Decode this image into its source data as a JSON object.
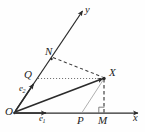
{
  "figure": {
    "background_color": "#fefefe",
    "stroke_color": "#2b2b2b",
    "light_stroke_color": "#9a9a9a",
    "width": 145,
    "height": 132
  },
  "axes": {
    "x_axis": {
      "label": "x",
      "origin": [
        14,
        113
      ],
      "tip": [
        140,
        113
      ],
      "arrow": true
    },
    "y_axis": {
      "label": "y",
      "origin": [
        14,
        113
      ],
      "tip": [
        84,
        8
      ],
      "arrow": true
    }
  },
  "basis_vectors": [
    {
      "name": "e1",
      "label": "e",
      "subscript": "1",
      "along": "x-axis",
      "tip": [
        44,
        113
      ]
    },
    {
      "name": "e2",
      "label": "e",
      "subscript": "2",
      "along": "y-axis",
      "tip": [
        33,
        85
      ]
    }
  ],
  "points": [
    {
      "name": "O",
      "label": "O",
      "x": 14,
      "y": 113
    },
    {
      "name": "N",
      "label": "N",
      "x": 50,
      "y": 58
    },
    {
      "name": "Q",
      "label": "Q",
      "x": 36,
      "y": 79
    },
    {
      "name": "X",
      "label": "X",
      "x": 104,
      "y": 78
    },
    {
      "name": "P",
      "label": "P",
      "x": 82,
      "y": 113
    },
    {
      "name": "M",
      "label": "M",
      "x": 104,
      "y": 113
    }
  ],
  "segments": [
    {
      "name": "vector-OX",
      "from": "O",
      "to": "X",
      "style": "solid-arrow",
      "weight": "bold"
    },
    {
      "name": "segment-N-X",
      "from": "N",
      "to": "X",
      "style": "dashed"
    },
    {
      "name": "segment-Q-X",
      "from": "Q",
      "to": "X",
      "style": "dotted"
    },
    {
      "name": "segment-X-M",
      "from": "X",
      "to": "M",
      "style": "dashed"
    },
    {
      "name": "segment-X-P",
      "from": "X",
      "to": "P",
      "style": "thin-solid"
    }
  ],
  "markers": [
    {
      "name": "right-angle-at-M",
      "at": "M",
      "type": "right-angle-square"
    }
  ]
}
